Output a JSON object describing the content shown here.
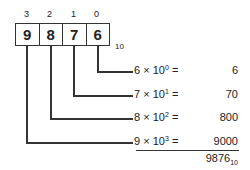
{
  "diagram": {
    "positions": [
      "3",
      "2",
      "1",
      "0"
    ],
    "digits": [
      "9",
      "8",
      "7",
      "6"
    ],
    "base_label": "10",
    "terms": [
      {
        "digit": "6",
        "times": "×",
        "base": "10",
        "exp": "0",
        "eq": "=",
        "value": "6"
      },
      {
        "digit": "7",
        "times": "×",
        "base": "10",
        "exp": "1",
        "eq": "=",
        "value": "70"
      },
      {
        "digit": "8",
        "times": "×",
        "base": "10",
        "exp": "2",
        "eq": "=",
        "value": "800"
      },
      {
        "digit": "9",
        "times": "×",
        "base": "10",
        "exp": "3",
        "eq": "=",
        "value": "9000"
      }
    ],
    "total": {
      "value": "9876",
      "base": "10"
    },
    "line_color": "#333333"
  }
}
